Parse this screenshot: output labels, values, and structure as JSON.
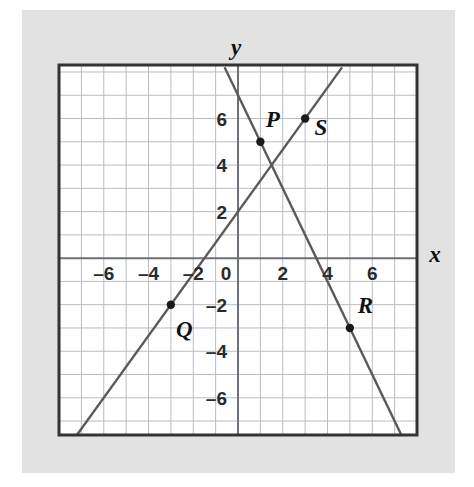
{
  "figure": {
    "kind": "coordinate-plane-graph",
    "background_color": "#ffffff",
    "panel_color": "#e2e2e2",
    "plot_color": "#ffffff",
    "grid_color": "#b9bcc4",
    "axis_color": "#6e7179",
    "border_color": "#333333",
    "line_color": "#5a5a5a",
    "point_color": "#1a1a1a",
    "text_color": "#111111"
  },
  "chart_data": {
    "type": "scatter",
    "title": "",
    "xlabel": "x",
    "ylabel": "y",
    "xlim": [
      -8,
      8
    ],
    "ylim": [
      -7.6,
      8.3
    ],
    "grid": true,
    "grid_step": 1,
    "legend": "none",
    "xticks": [
      -6,
      -4,
      -2,
      0,
      2,
      4,
      6
    ],
    "xtick_labels": [
      "–6",
      "–4",
      "–2",
      "0",
      "2",
      "4",
      "6"
    ],
    "yticks": [
      6,
      4,
      2,
      -2,
      -4,
      -6
    ],
    "ytick_labels": [
      "6",
      "4",
      "2",
      "–2",
      "–4",
      "–6"
    ],
    "points": [
      {
        "name": "P",
        "label": "P",
        "x": 1,
        "y": 5,
        "label_dx": 0.55,
        "label_dy": 1.0
      },
      {
        "name": "Q",
        "label": "Q",
        "x": -3,
        "y": -2,
        "label_dx": 0.6,
        "label_dy": -1.05
      },
      {
        "name": "R",
        "label": "R",
        "x": 5,
        "y": -3,
        "label_dx": 0.7,
        "label_dy": 1.0
      },
      {
        "name": "S",
        "label": "S",
        "x": 3,
        "y": 6,
        "label_dx": 0.7,
        "label_dy": -0.35
      }
    ],
    "series": [
      {
        "name": "line-PR",
        "through": [
          "P",
          "R"
        ],
        "slope": -2,
        "intercept": 7,
        "equation": "y = -2x + 7",
        "x_start": -0.6,
        "y_start": 8.2,
        "x_end": 7.75,
        "y_end": -8.5
      },
      {
        "name": "line-QS",
        "through": [
          "Q",
          "S"
        ],
        "slope": 1.3333,
        "intercept": 2,
        "equation": "y = (4/3)x + 2",
        "x_start": -7.95,
        "y_start": -8.6,
        "x_end": 4.65,
        "y_end": 8.2
      }
    ]
  },
  "axes": {
    "x_axis_label": "x",
    "y_axis_label": "y"
  }
}
